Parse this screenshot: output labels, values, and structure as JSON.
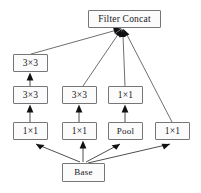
{
  "diagram": {
    "type": "neural-network-block-diagram",
    "background_color": "#ffffff",
    "box_fill_color": "#fbfbfb",
    "box_border_color": "#76767a",
    "edge_color": "#3a3a3e",
    "text_color": "#17171a",
    "nodes": [
      {
        "id": "filter_concat",
        "label": "Filter Concat",
        "x": 88,
        "y": 10,
        "w": 73,
        "h": 18,
        "column": "top",
        "row": 0
      },
      {
        "id": "left_3x3_top",
        "label": "3×3",
        "x": 13,
        "y": 54,
        "w": 35,
        "h": 18,
        "column": "left",
        "row": 1
      },
      {
        "id": "left_3x3_mid",
        "label": "3×3",
        "x": 13,
        "y": 86,
        "w": 35,
        "h": 18,
        "column": "left",
        "row": 2
      },
      {
        "id": "mid_3x3",
        "label": "3×3",
        "x": 62,
        "y": 86,
        "w": 35,
        "h": 18,
        "column": "mid",
        "row": 2
      },
      {
        "id": "pool_1x1",
        "label": "1×1",
        "x": 108,
        "y": 86,
        "w": 35,
        "h": 18,
        "column": "pool",
        "row": 2
      },
      {
        "id": "left_1x1",
        "label": "1×1",
        "x": 13,
        "y": 122,
        "w": 35,
        "h": 18,
        "column": "left",
        "row": 3
      },
      {
        "id": "mid_1x1",
        "label": "1×1",
        "x": 62,
        "y": 122,
        "w": 35,
        "h": 18,
        "column": "mid",
        "row": 3
      },
      {
        "id": "pool",
        "label": "Pool",
        "x": 108,
        "y": 122,
        "w": 35,
        "h": 18,
        "column": "pool",
        "row": 3
      },
      {
        "id": "right_1x1",
        "label": "1×1",
        "x": 155,
        "y": 122,
        "w": 35,
        "h": 18,
        "column": "right",
        "row": 3
      },
      {
        "id": "base",
        "label": "Base",
        "x": 62,
        "y": 163,
        "w": 43,
        "h": 19,
        "column": "mid",
        "row": 4
      }
    ],
    "edges": [
      {
        "from": "base",
        "to": "left_1x1",
        "kind": "fanout"
      },
      {
        "from": "base",
        "to": "mid_1x1",
        "kind": "vertical"
      },
      {
        "from": "base",
        "to": "pool",
        "kind": "fanout"
      },
      {
        "from": "base",
        "to": "right_1x1",
        "kind": "fanout"
      },
      {
        "from": "left_1x1",
        "to": "left_3x3_mid",
        "kind": "vertical"
      },
      {
        "from": "mid_1x1",
        "to": "mid_3x3",
        "kind": "vertical"
      },
      {
        "from": "pool",
        "to": "pool_1x1",
        "kind": "vertical"
      },
      {
        "from": "left_3x3_mid",
        "to": "left_3x3_top",
        "kind": "vertical"
      },
      {
        "from": "left_3x3_top",
        "to": "filter_concat",
        "kind": "converge"
      },
      {
        "from": "mid_3x3",
        "to": "filter_concat",
        "kind": "converge"
      },
      {
        "from": "pool_1x1",
        "to": "filter_concat",
        "kind": "converge"
      },
      {
        "from": "right_1x1",
        "to": "filter_concat",
        "kind": "converge"
      }
    ],
    "converge_point": {
      "x": 122,
      "y": 29
    }
  }
}
